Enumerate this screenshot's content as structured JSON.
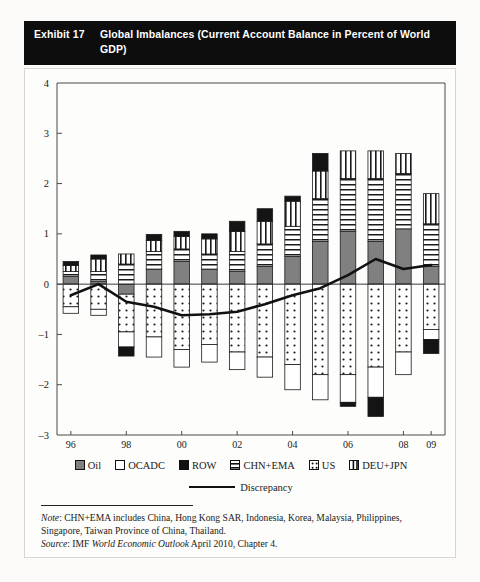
{
  "exhibit": {
    "label": "Exhibit 17",
    "title": "Global Imbalances (Current Account Balance in Percent of World GDP)"
  },
  "notes": {
    "note_label": "Note",
    "note_text": ": CHN+EMA includes China, Hong Kong SAR, Indonesia, Korea, Malaysia, Philippines, Singapore, Taiwan Province of China, Thailand.",
    "source_label": "Source",
    "source_text": ": IMF ",
    "source_italic": "World Economic Outlook",
    "source_tail": " April 2010, Chapter 4."
  },
  "legend": {
    "items": [
      {
        "key": "oil",
        "label": "Oil",
        "pattern": "solid-gray",
        "color": "#808080"
      },
      {
        "key": "ocadc",
        "label": "OCADC",
        "pattern": "solid-white",
        "color": "#ffffff"
      },
      {
        "key": "row",
        "label": "ROW",
        "pattern": "solid-black",
        "color": "#111111"
      },
      {
        "key": "chn_ema",
        "label": "CHN+EMA",
        "pattern": "horizontal-lines",
        "color": "#ffffff"
      },
      {
        "key": "us",
        "label": "US",
        "pattern": "dots",
        "color": "#ffffff"
      },
      {
        "key": "deu_jpn",
        "label": "DEU+JPN",
        "pattern": "vertical-lines",
        "color": "#ffffff"
      }
    ],
    "line_label": "Discrepancy"
  },
  "chart_data": {
    "type": "bar",
    "title": "Global Imbalances (Current Account Balance in Percent of World GDP)",
    "xlabel": "",
    "ylabel": "",
    "ylim": [
      -3,
      4
    ],
    "yticks": [
      -3,
      -2,
      -1,
      0,
      1,
      2,
      3,
      4
    ],
    "grid": false,
    "stacked": true,
    "legend_position": "bottom",
    "categories": [
      "96",
      "97",
      "98",
      "99",
      "00",
      "01",
      "02",
      "03",
      "04",
      "05",
      "06",
      "07",
      "08",
      "09"
    ],
    "series": [
      {
        "name": "Oil",
        "pattern": "solid-gray",
        "values": [
          0.15,
          0.05,
          -0.2,
          0.3,
          0.45,
          0.3,
          0.25,
          0.35,
          0.55,
          0.85,
          1.05,
          0.85,
          1.1,
          0.35
        ]
      },
      {
        "name": "CHN+EMA",
        "pattern": "horizontal-lines",
        "values": [
          0.1,
          0.2,
          0.4,
          0.35,
          0.25,
          0.3,
          0.4,
          0.45,
          0.6,
          0.85,
          1.05,
          1.25,
          1.1,
          0.85
        ]
      },
      {
        "name": "DEU+JPN",
        "pattern": "vertical-lines",
        "values": [
          0.12,
          0.25,
          0.2,
          0.22,
          0.25,
          0.3,
          0.4,
          0.45,
          0.5,
          0.55,
          0.55,
          0.55,
          0.4,
          0.6
        ]
      },
      {
        "name": "ROW",
        "pattern": "solid-black",
        "values": [
          0.08,
          0.08,
          0.0,
          0.12,
          0.1,
          0.1,
          0.2,
          0.25,
          0.1,
          0.35,
          0.0,
          0.0,
          0.0,
          0.0
        ]
      },
      {
        "name": "US",
        "pattern": "dots",
        "values": [
          -0.45,
          -0.5,
          -0.75,
          -1.05,
          -1.3,
          -1.2,
          -1.35,
          -1.45,
          -1.6,
          -1.8,
          -1.8,
          -1.65,
          -1.35,
          -0.9
        ]
      },
      {
        "name": "OCADC",
        "pattern": "solid-white",
        "values": [
          -0.13,
          -0.12,
          -0.3,
          -0.4,
          -0.35,
          -0.35,
          -0.35,
          -0.4,
          -0.5,
          -0.5,
          -0.55,
          -0.6,
          -0.45,
          -0.2
        ]
      },
      {
        "name": "ROW-neg",
        "pattern": "solid-black",
        "values": [
          0.0,
          0.0,
          -0.18,
          0.0,
          0.0,
          0.0,
          0.0,
          0.0,
          0.0,
          0.0,
          -0.08,
          -0.38,
          0.0,
          -0.28
        ]
      }
    ],
    "line_series": {
      "name": "Discrepancy",
      "values": [
        -0.22,
        0.0,
        -0.35,
        -0.45,
        -0.62,
        -0.6,
        -0.55,
        -0.4,
        -0.22,
        -0.08,
        0.18,
        0.5,
        0.3,
        0.38
      ]
    }
  }
}
